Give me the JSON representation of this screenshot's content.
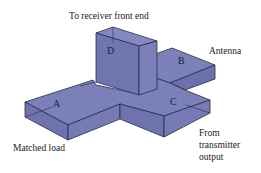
{
  "diagram": {
    "ports": {
      "A": "A",
      "B": "B",
      "C": "C",
      "D": "D"
    },
    "labels": {
      "top": "To receiver front end",
      "antenna": "Antenna",
      "matched_load": "Matched load",
      "from_line1": "From",
      "from_line2": "transmitter",
      "from_line3": "output"
    },
    "colors": {
      "fill_top": "#7b80b8",
      "fill_front": "#6e73ad",
      "fill_side": "#8489c0",
      "edge": "#2a2c4a",
      "text": "#222222"
    }
  }
}
